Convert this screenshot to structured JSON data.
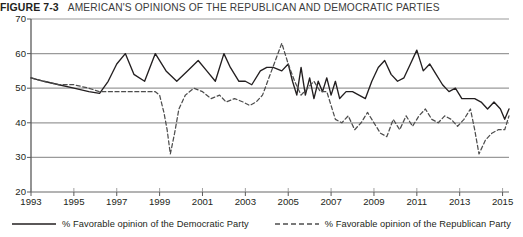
{
  "figure": {
    "label": "FIGURE 7-3",
    "title": "AMERICAN'S OPINIONS OF THE REPUBLICAN AND DEMOCRATIC PARTIES"
  },
  "legend": {
    "items": [
      {
        "key": "democratic",
        "label": "% Favorable opinion of the Democratic Party",
        "style": "solid",
        "color": "#231f20"
      },
      {
        "key": "republican",
        "label": "% Favorable opinion of the Republican Party",
        "style": "dashed",
        "color": "#4d4d4d"
      }
    ]
  },
  "axis": {
    "y_ticks": [
      "70",
      "60",
      "50",
      "40",
      "30",
      "20"
    ],
    "x_ticks": [
      "1993",
      "1995",
      "1997",
      "1999",
      "2001",
      "2003",
      "2005",
      "2007",
      "2009",
      "2011",
      "2013",
      "2015"
    ]
  },
  "chart_data": {
    "type": "line",
    "title": "AMERICAN'S OPINIONS OF THE REPUBLICAN AND DEMOCRATIC PARTIES",
    "xlabel": "",
    "ylabel": "",
    "xlim": [
      1993,
      2015.3
    ],
    "ylim": [
      20,
      70
    ],
    "y_ticks": [
      20,
      30,
      40,
      50,
      60,
      70
    ],
    "x_ticks": [
      1993,
      1995,
      1997,
      1999,
      2001,
      2003,
      2005,
      2007,
      2009,
      2011,
      2013,
      2015
    ],
    "grid": "horizontal",
    "legend_position": "bottom",
    "series": [
      {
        "name": "% Favorable opinion of the Democratic Party",
        "style": "solid",
        "color": "#231f20",
        "points": [
          [
            1993.0,
            53
          ],
          [
            1993.6,
            52
          ],
          [
            1994.3,
            51
          ],
          [
            1995.0,
            50
          ],
          [
            1995.7,
            49
          ],
          [
            1996.2,
            48.5
          ],
          [
            1996.6,
            52
          ],
          [
            1997.0,
            57
          ],
          [
            1997.4,
            60
          ],
          [
            1997.8,
            54
          ],
          [
            1998.3,
            52
          ],
          [
            1998.8,
            60
          ],
          [
            1999.3,
            55
          ],
          [
            1999.8,
            52
          ],
          [
            2000.3,
            55
          ],
          [
            2000.8,
            58
          ],
          [
            2001.2,
            55
          ],
          [
            2001.6,
            52
          ],
          [
            2002.0,
            60
          ],
          [
            2002.3,
            56
          ],
          [
            2002.7,
            52
          ],
          [
            2003.0,
            52
          ],
          [
            2003.3,
            51
          ],
          [
            2003.7,
            55
          ],
          [
            2004.0,
            56
          ],
          [
            2004.3,
            56
          ],
          [
            2004.7,
            55
          ],
          [
            2005.0,
            57
          ],
          [
            2005.2,
            52
          ],
          [
            2005.4,
            48
          ],
          [
            2005.6,
            56
          ],
          [
            2005.8,
            48
          ],
          [
            2006.0,
            53
          ],
          [
            2006.2,
            47
          ],
          [
            2006.4,
            52
          ],
          [
            2006.6,
            49
          ],
          [
            2006.8,
            53
          ],
          [
            2007.0,
            48
          ],
          [
            2007.2,
            52
          ],
          [
            2007.4,
            47
          ],
          [
            2007.7,
            49
          ],
          [
            2008.0,
            49
          ],
          [
            2008.3,
            48
          ],
          [
            2008.6,
            47
          ],
          [
            2008.9,
            52
          ],
          [
            2009.2,
            56
          ],
          [
            2009.5,
            58
          ],
          [
            2009.8,
            54
          ],
          [
            2010.1,
            52
          ],
          [
            2010.4,
            53
          ],
          [
            2010.7,
            57
          ],
          [
            2011.0,
            61
          ],
          [
            2011.3,
            55
          ],
          [
            2011.6,
            57
          ],
          [
            2011.9,
            54
          ],
          [
            2012.2,
            51
          ],
          [
            2012.5,
            49
          ],
          [
            2012.8,
            50
          ],
          [
            2013.1,
            47
          ],
          [
            2013.4,
            47
          ],
          [
            2013.7,
            47
          ],
          [
            2014.0,
            46
          ],
          [
            2014.3,
            44
          ],
          [
            2014.6,
            46
          ],
          [
            2014.9,
            44
          ],
          [
            2015.1,
            41
          ],
          [
            2015.3,
            44
          ]
        ]
      },
      {
        "name": "% Favorable opinion of the Republican Party",
        "style": "dashed",
        "color": "#4d4d4d",
        "points": [
          [
            1993.0,
            53
          ],
          [
            1993.6,
            52
          ],
          [
            1994.3,
            51
          ],
          [
            1995.0,
            51
          ],
          [
            1995.7,
            50
          ],
          [
            1996.2,
            49
          ],
          [
            1996.6,
            49
          ],
          [
            1997.2,
            49
          ],
          [
            1997.8,
            49
          ],
          [
            1998.3,
            49
          ],
          [
            1998.8,
            49
          ],
          [
            1999.0,
            48
          ],
          [
            1999.2,
            43
          ],
          [
            1999.35,
            38
          ],
          [
            1999.5,
            31
          ],
          [
            1999.7,
            37
          ],
          [
            1999.9,
            44
          ],
          [
            2000.2,
            48
          ],
          [
            2000.6,
            50
          ],
          [
            2001.0,
            49
          ],
          [
            2001.4,
            47
          ],
          [
            2001.8,
            48
          ],
          [
            2002.1,
            46
          ],
          [
            2002.5,
            47
          ],
          [
            2002.9,
            46
          ],
          [
            2003.2,
            45
          ],
          [
            2003.5,
            46
          ],
          [
            2003.8,
            48
          ],
          [
            2004.1,
            53
          ],
          [
            2004.4,
            58
          ],
          [
            2004.7,
            63
          ],
          [
            2005.0,
            57
          ],
          [
            2005.3,
            52
          ],
          [
            2005.6,
            48
          ],
          [
            2005.9,
            50
          ],
          [
            2006.2,
            52
          ],
          [
            2006.5,
            49
          ],
          [
            2006.8,
            49
          ],
          [
            2007.0,
            45
          ],
          [
            2007.2,
            41
          ],
          [
            2007.5,
            40
          ],
          [
            2007.8,
            42
          ],
          [
            2008.1,
            38
          ],
          [
            2008.4,
            40
          ],
          [
            2008.7,
            43
          ],
          [
            2009.0,
            40
          ],
          [
            2009.3,
            37
          ],
          [
            2009.6,
            36
          ],
          [
            2009.9,
            41
          ],
          [
            2010.2,
            38
          ],
          [
            2010.5,
            42
          ],
          [
            2010.8,
            39
          ],
          [
            2011.1,
            42
          ],
          [
            2011.4,
            44
          ],
          [
            2011.7,
            41
          ],
          [
            2012.0,
            40
          ],
          [
            2012.3,
            42
          ],
          [
            2012.6,
            41
          ],
          [
            2012.9,
            39
          ],
          [
            2013.2,
            41
          ],
          [
            2013.5,
            44
          ],
          [
            2013.7,
            38
          ],
          [
            2013.9,
            31
          ],
          [
            2014.2,
            35
          ],
          [
            2014.5,
            37
          ],
          [
            2014.8,
            38
          ],
          [
            2015.1,
            38
          ],
          [
            2015.3,
            42
          ]
        ]
      }
    ]
  }
}
